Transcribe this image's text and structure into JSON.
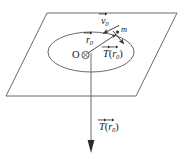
{
  "figure": {
    "background_color": "#ffffff",
    "stroke_color": "#5a5a5a",
    "ink_color": "#1a1a1a",
    "labels": {
      "velocity_vector": "v",
      "velocity_subscript": "0",
      "mass": "m",
      "position_vector": "r",
      "position_subscript": "0",
      "origin": "O",
      "tension_plane_symbol": "T",
      "tension_plane_arg": "r",
      "tension_plane_arg_subscript": "0",
      "tension_bottom_symbol": "T",
      "tension_bottom_arg": "r",
      "tension_bottom_arg_subscript": "0",
      "paren_open": "(",
      "paren_close": ")"
    },
    "icons": {
      "plane": "parallelogram-plane",
      "orbit": "ellipse-orbit",
      "origin_marker": "circle-dot-origin",
      "down_arrow": "downward-force-arrow",
      "velocity_arrow": "velocity-arrow",
      "radius_arrow": "radius-arrow",
      "tension_arrow": "tension-arrow"
    },
    "geometry": {
      "plane_corners": [
        [
          47,
          13
        ],
        [
          177,
          13
        ],
        [
          136,
          96
        ],
        [
          6,
          96
        ]
      ],
      "orbit_center": [
        91,
        52
      ],
      "orbit_rx": 43,
      "orbit_ry": 20,
      "mass_position": [
        118,
        33
      ],
      "down_arrow_start": [
        91,
        53
      ],
      "down_arrow_end": [
        91,
        152
      ]
    }
  }
}
